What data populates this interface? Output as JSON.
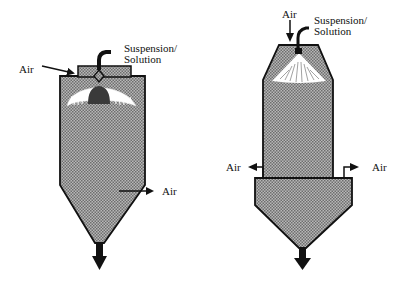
{
  "diagram": {
    "colors": {
      "fill_pattern_dark": "#6e6e6e",
      "fill_pattern_light": "#b8b8b8",
      "outline": "#111111",
      "spray": "#ffffff",
      "atomizer": "#3a3a3a"
    },
    "left_dryer": {
      "air_inlet_label": "Air",
      "feed_label_line1": "Suspension/",
      "feed_label_line2": "Solution",
      "air_outlet_label": "Air"
    },
    "right_dryer": {
      "air_inlet_label": "Air",
      "feed_label_line1": "Suspension/",
      "feed_label_line2": "Solution",
      "air_outlet_left_label": "Air",
      "air_outlet_right_label": "Air"
    }
  }
}
